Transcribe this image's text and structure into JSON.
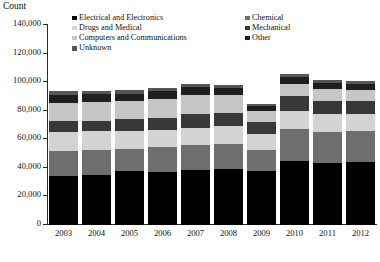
{
  "title_fragment": "",
  "axis": {
    "y_title": "Count",
    "y_ticks": [
      "0",
      "20,000",
      "40,000",
      "60,000",
      "80,000",
      "100,000",
      "120,000",
      "140,000"
    ],
    "y_tick_values": [
      0,
      20000,
      40000,
      60000,
      80000,
      100000,
      120000,
      140000
    ],
    "y_min": 0,
    "y_max": 140000
  },
  "legend": {
    "column1": [
      {
        "label": "Electrical and Electronics",
        "color": "#000000"
      },
      {
        "label": "Drugs and Medical",
        "color": "#d3d3d3"
      },
      {
        "label": "Computers and Communications",
        "color": "#c6c6c6"
      },
      {
        "label": "Unknown",
        "color": "#565656"
      }
    ],
    "column2": [
      {
        "label": "Chemical",
        "color": "#6e6e6e"
      },
      {
        "label": "Mechanical",
        "color": "#383838"
      },
      {
        "label": "Other",
        "color": "#1f1f1f"
      }
    ]
  },
  "chart_data": {
    "type": "bar",
    "title": "",
    "subtitle": "",
    "xlabel": "",
    "ylabel": "Count",
    "ylim": [
      0,
      140000
    ],
    "grid": false,
    "stacked": true,
    "legend_position": "top",
    "categories": [
      "2003",
      "2004",
      "2005",
      "2006",
      "2007",
      "2008",
      "2009",
      "2010",
      "2011",
      "2012"
    ],
    "series": [
      {
        "name": "Electrical and Electronics",
        "color": "#000000",
        "values": [
          34000,
          35000,
          37500,
          37000,
          38500,
          39000,
          37500,
          45000,
          43500,
          44000
        ]
      },
      {
        "name": "Chemical",
        "color": "#6e6e6e",
        "values": [
          18000,
          17500,
          15500,
          17500,
          17500,
          18000,
          15000,
          22000,
          21500,
          21500
        ]
      },
      {
        "name": "Drugs and Medical",
        "color": "#d3d3d3",
        "values": [
          13000,
          13000,
          13000,
          12000,
          12000,
          12000,
          11000,
          13000,
          12500,
          12500
        ]
      },
      {
        "name": "Mechanical",
        "color": "#383838",
        "values": [
          7500,
          7500,
          8000,
          8500,
          9500,
          9500,
          8500,
          10500,
          9500,
          9000
        ]
      },
      {
        "name": "Computers and Communications",
        "color": "#c6c6c6",
        "values": [
          13000,
          13000,
          13000,
          13000,
          13500,
          12500,
          7500,
          8000,
          8000,
          7500
        ]
      },
      {
        "name": "Other",
        "color": "#1f1f1f",
        "values": [
          5500,
          5500,
          5000,
          5500,
          5500,
          5000,
          3500,
          5000,
          4500,
          4500
        ]
      },
      {
        "name": "Unknown",
        "color": "#565656",
        "values": [
          2500,
          2500,
          2500,
          2500,
          2500,
          2000,
          1500,
          2500,
          2000,
          2000
        ]
      }
    ],
    "totals": [
      93500,
      94000,
      94500,
      96000,
      99000,
      98000,
      84500,
      106000,
      101500,
      101000
    ]
  }
}
